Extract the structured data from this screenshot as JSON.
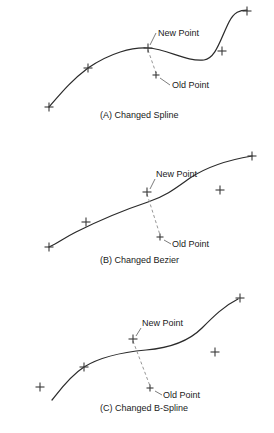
{
  "figure": {
    "background_color": "#ffffff",
    "curve_color": "#2b2b2b",
    "marker_color": "#3a3a3a",
    "dashed_color": "#8a8a8a",
    "text_color": "#1a1a1a"
  },
  "labels": {
    "new_point": "New Point",
    "old_point": "Old Point"
  },
  "panels": [
    {
      "id": "panel-a",
      "caption": "(A)  Changed Spline",
      "caption_x": 100,
      "caption_y": 118,
      "curve_path": "M 49,107 C 62,92 72,80 88,68 C 110,53 132,47 148,48 C 168,49 186,62 204,60 C 216,58 220,40 229,22 C 234,12 240,10 247,10",
      "new_point": {
        "x": 148,
        "y": 48
      },
      "old_point": {
        "x": 156,
        "y": 75
      },
      "new_label": {
        "x": 158,
        "y": 36
      },
      "new_leader": "M 156,33 L 150,45",
      "old_label": {
        "x": 172,
        "y": 88
      },
      "old_leader": "M 170,85 L 160,78",
      "dashed_path": "M 148,50 L 156,73",
      "markers": [
        {
          "x": 49,
          "y": 107,
          "size": 9
        },
        {
          "x": 88,
          "y": 68,
          "size": 9
        },
        {
          "x": 148,
          "y": 48,
          "size": 9
        },
        {
          "x": 222,
          "y": 51,
          "size": 9
        },
        {
          "x": 247,
          "y": 11,
          "size": 9
        },
        {
          "x": 156,
          "y": 75,
          "size": 7
        }
      ]
    },
    {
      "id": "panel-b",
      "caption": "(B)  Changed Bezier",
      "caption_x": 100,
      "caption_y": 263,
      "curve_path": "M 49,247 C 58,243 64,238 76,232 C 96,222 124,210 148,202 C 166,196 176,188 190,178 C 208,166 228,160 252,156",
      "new_point": {
        "x": 147,
        "y": 192
      },
      "old_point": {
        "x": 160,
        "y": 237
      },
      "new_label": {
        "x": 156,
        "y": 177
      },
      "new_leader": "M 155,179 L 150,189",
      "old_label": {
        "x": 172,
        "y": 247
      },
      "old_leader": "M 171,244 L 164,240},",
      "old_leader_path": "M 171,244 L 164,240",
      "dashed_path": "M 147,194 L 160,235",
      "markers": [
        {
          "x": 49,
          "y": 247,
          "size": 9
        },
        {
          "x": 86,
          "y": 222,
          "size": 9
        },
        {
          "x": 147,
          "y": 192,
          "size": 9
        },
        {
          "x": 220,
          "y": 190,
          "size": 9
        },
        {
          "x": 252,
          "y": 156,
          "size": 9
        },
        {
          "x": 160,
          "y": 237,
          "size": 7
        }
      ]
    },
    {
      "id": "panel-c",
      "caption": "(C)  Changed B-Spline",
      "caption_x": 100,
      "caption_y": 411,
      "curve_path": "M 52,400 C 60,390 70,376 84,367 C 100,357 124,352 146,350 C 170,348 188,342 202,328 C 214,316 224,306 238,299",
      "new_point": {
        "x": 133,
        "y": 339
      },
      "old_point": {
        "x": 150,
        "y": 388
      },
      "new_label": {
        "x": 142,
        "y": 326
      },
      "new_leader": "M 141,328 L 136,336",
      "old_label": {
        "x": 163,
        "y": 398
      },
      "old_leader": "M 162,395 L 155,391",
      "dashed_path": "M 133,341 L 150,386",
      "markers": [
        {
          "x": 40,
          "y": 387,
          "size": 9
        },
        {
          "x": 84,
          "y": 367,
          "size": 9
        },
        {
          "x": 133,
          "y": 339,
          "size": 9
        },
        {
          "x": 215,
          "y": 352,
          "size": 9
        },
        {
          "x": 240,
          "y": 298,
          "size": 9
        },
        {
          "x": 150,
          "y": 388,
          "size": 7
        }
      ]
    }
  ]
}
